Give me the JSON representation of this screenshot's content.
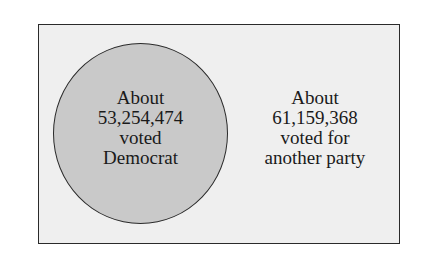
{
  "diagram": {
    "type": "venn",
    "universe": {
      "fill_color": "#efefef",
      "border_color": "#2a2a2a"
    },
    "sets": [
      {
        "name": "Democrat",
        "fill_color": "#c9c9c9",
        "label_lines": [
          "About",
          "53,254,474",
          "voted",
          "Democrat"
        ]
      }
    ],
    "outside": {
      "label_lines": [
        "About",
        "61,159,368",
        "voted for",
        "another party"
      ]
    }
  }
}
